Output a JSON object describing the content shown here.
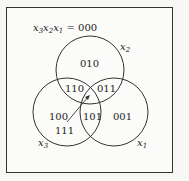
{
  "diagram": {
    "type": "venn",
    "title": {
      "prefix": "x",
      "s3": "3",
      "s2": "2",
      "s1": "1",
      "x": "x",
      "equals": " = 000"
    },
    "circles": [
      {
        "name": "x2",
        "var": "x",
        "sub": "2"
      },
      {
        "name": "x3",
        "var": "x",
        "sub": "3"
      },
      {
        "name": "x1",
        "var": "x",
        "sub": "1"
      }
    ],
    "regions": {
      "only_x2": "010",
      "x3_x2": "110",
      "x2_x1": "011",
      "only_x3": "100",
      "x3_x1": "101",
      "only_x1": "001",
      "all": "111"
    },
    "colors": {
      "line": "#333333",
      "background": "#fbfbf9"
    }
  }
}
